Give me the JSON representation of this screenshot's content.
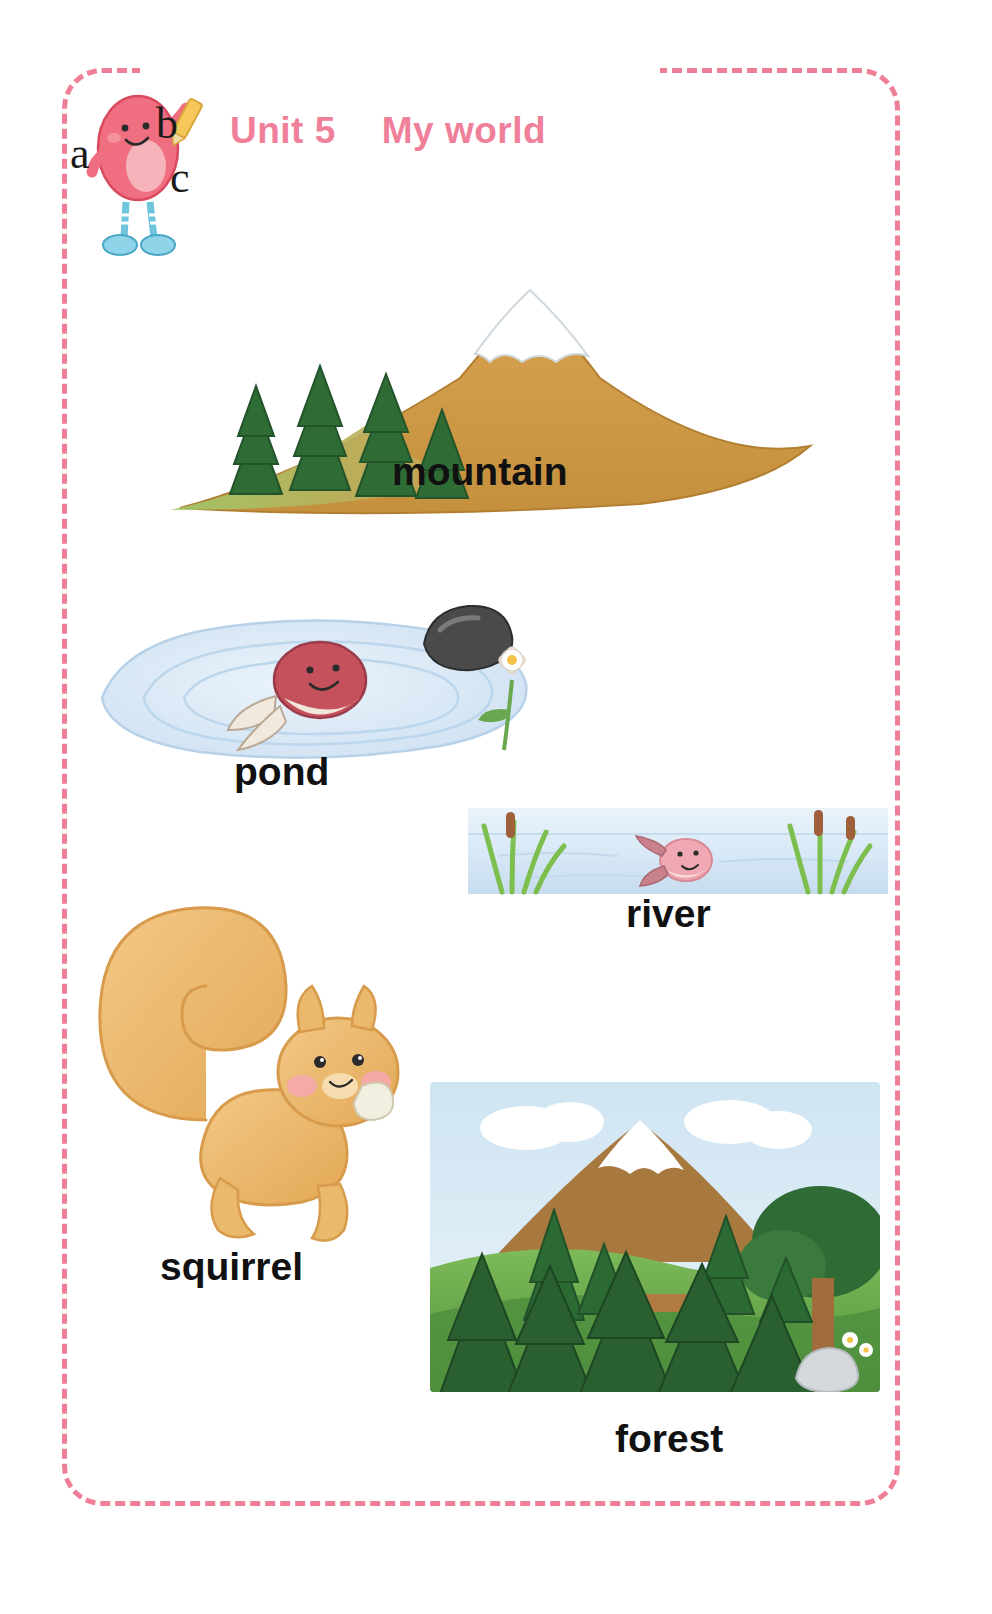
{
  "page": {
    "background_color": "#ffffff",
    "frame_color": "#ef7f96",
    "frame_style": "dashed-rounded"
  },
  "header": {
    "unit_label": "Unit 5",
    "title": "My world",
    "text_color": "#f0809a",
    "mascot": {
      "name": "abc-character",
      "letters": [
        "a",
        "b",
        "c"
      ],
      "body_color": "#ef6e7f",
      "shoe_color": "#8fd4e8",
      "pencil_color": "#f6c85c"
    }
  },
  "vocabulary": {
    "items": [
      {
        "id": "mountain",
        "caption": "mountain",
        "icon": "mountain-illustration",
        "colors": {
          "rock": "#cf9a4a",
          "snow": "#ffffff",
          "tree": "#2f6b34"
        }
      },
      {
        "id": "pond",
        "caption": "pond",
        "icon": "pond-illustration",
        "colors": {
          "water": "#d5e6f5",
          "fish": "#c4515c",
          "rock": "#3d3d3d",
          "flower": "#ffffff"
        }
      },
      {
        "id": "river",
        "caption": "river",
        "icon": "river-illustration",
        "colors": {
          "water": "#dbeaf6",
          "reed": "#7dbf4f",
          "fish": "#f0a9b4"
        }
      },
      {
        "id": "squirrel",
        "caption": "squirrel",
        "icon": "squirrel-illustration",
        "colors": {
          "fur": "#edb86a",
          "cheek": "#f6a8b2",
          "nut": "#f3efe0"
        }
      },
      {
        "id": "forest",
        "caption": "forest",
        "icon": "forest-illustration",
        "colors": {
          "sky": "#cfe4f2",
          "grass": "#63a84c",
          "tree": "#2c5f32",
          "mountain": "#a8793f"
        }
      }
    ]
  }
}
